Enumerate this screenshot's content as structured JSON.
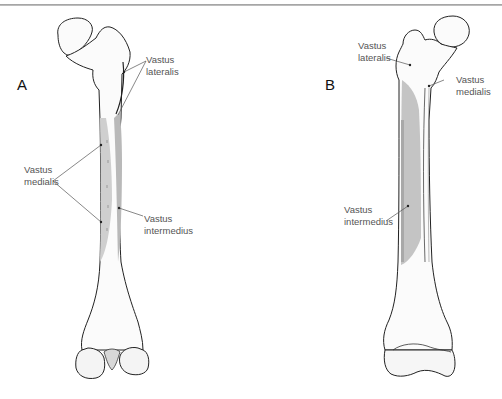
{
  "figure": {
    "panels": [
      {
        "id": "A",
        "letter": "A",
        "view": "anterior",
        "labels": [
          {
            "line1": "Vastus",
            "line2": "lateralis"
          },
          {
            "line1": "Vastus",
            "line2": "medialis"
          },
          {
            "line1": "Vastus",
            "line2": "intermedius"
          }
        ]
      },
      {
        "id": "B",
        "letter": "B",
        "view": "posterior",
        "labels": [
          {
            "line1": "Vastus",
            "line2": "lateralis"
          },
          {
            "line1": "Vastus",
            "line2": "medialis"
          },
          {
            "line1": "Vastus",
            "line2": "intermedius"
          }
        ]
      }
    ],
    "colors": {
      "outline": "#222222",
      "muscle_area": "#c4c4c4",
      "muscle_area_dark": "#a8a8a8",
      "label_text": "#555555",
      "leader_line": "#555555",
      "rule": "#aaaaaa"
    }
  }
}
